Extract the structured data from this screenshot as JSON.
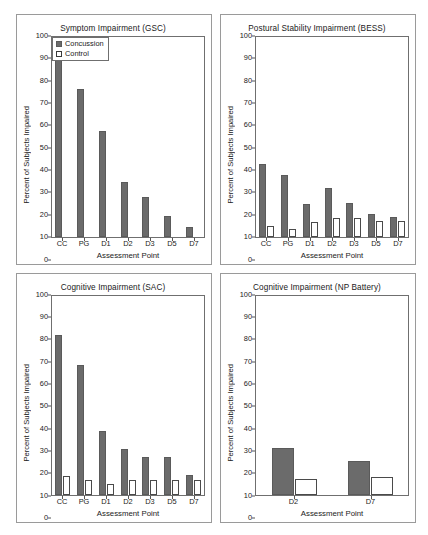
{
  "figure": {
    "background": "#ffffff",
    "series_colors": {
      "concussion": "#6b6b6b",
      "control": "#ffffff"
    },
    "shared": {
      "ylabel": "Percent of Subjects Impaired",
      "xlabel": "Assessment Point",
      "yticks": [
        0,
        10,
        20,
        30,
        40,
        50,
        60,
        70,
        80,
        90,
        100
      ],
      "legend_concussion": "Concussion",
      "legend_control": "Control"
    }
  },
  "chart_data": [
    {
      "type": "bar",
      "panel": "top-left",
      "title": "Symptom Impairment (GSC)",
      "xlabel": "Assessment Point",
      "ylabel": "Percent of Subjects Impaired",
      "ylim": [
        0,
        100
      ],
      "yticks": [
        0,
        10,
        20,
        30,
        40,
        50,
        60,
        70,
        80,
        90,
        100
      ],
      "grid": false,
      "legend": true,
      "legend_position": "top-right-inside",
      "categories": [
        "CC",
        "PG",
        "D1",
        "D2",
        "D3",
        "D5",
        "D7"
      ],
      "series": [
        {
          "name": "Concussion",
          "values": [
            88.5,
            74,
            53,
            27.5,
            20,
            10.5,
            5
          ]
        },
        {
          "name": "Control",
          "values": [
            0,
            0,
            0,
            0,
            0,
            0,
            0
          ]
        }
      ]
    },
    {
      "type": "bar",
      "panel": "top-right",
      "title": "Postural Stability Impairment (BESS)",
      "xlabel": "Assessment Point",
      "ylabel": "Percent of Subjects Impaired",
      "ylim": [
        0,
        100
      ],
      "yticks": [
        0,
        10,
        20,
        30,
        40,
        50,
        60,
        70,
        80,
        90,
        100
      ],
      "grid": false,
      "legend": false,
      "categories": [
        "CC",
        "PG",
        "D1",
        "D2",
        "D3",
        "D5",
        "D7"
      ],
      "series": [
        {
          "name": "Concussion",
          "values": [
            36.5,
            31,
            16.5,
            24.5,
            17,
            11.5,
            10
          ]
        },
        {
          "name": "Control",
          "values": [
            5.5,
            4,
            7.5,
            9.5,
            9.5,
            8,
            8
          ]
        }
      ]
    },
    {
      "type": "bar",
      "panel": "bottom-left",
      "title": "Cognitive Impairment (SAC)",
      "xlabel": "Assessment Point",
      "ylabel": "Percent of Subjects Impaired",
      "ylim": [
        0,
        100
      ],
      "yticks": [
        0,
        10,
        20,
        30,
        40,
        50,
        60,
        70,
        80,
        90,
        100
      ],
      "grid": false,
      "legend": false,
      "categories": [
        "CC",
        "PG",
        "D1",
        "D2",
        "D3",
        "D5",
        "D7"
      ],
      "series": [
        {
          "name": "Concussion",
          "values": [
            80,
            65,
            32,
            23,
            19,
            19,
            10
          ]
        },
        {
          "name": "Control",
          "values": [
            9.5,
            7.5,
            5.5,
            7.5,
            7.5,
            7.5,
            7.5
          ]
        }
      ]
    },
    {
      "type": "bar",
      "panel": "bottom-right",
      "title": "Cognitive Impairment (NP Battery)",
      "xlabel": "Assessment Point",
      "ylabel": "Percent of Subjects Impaired",
      "ylim": [
        0,
        100
      ],
      "yticks": [
        0,
        10,
        20,
        30,
        40,
        50,
        60,
        70,
        80,
        90,
        100
      ],
      "grid": false,
      "legend": false,
      "categories": [
        "D2",
        "D7"
      ],
      "series": [
        {
          "name": "Concussion",
          "values": [
            23.5,
            17
          ]
        },
        {
          "name": "Control",
          "values": [
            8,
            9
          ]
        }
      ]
    }
  ]
}
